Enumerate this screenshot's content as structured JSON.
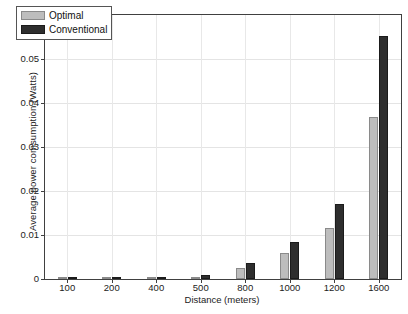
{
  "chart_data": {
    "type": "bar",
    "title": "",
    "xlabel": "Distance (meters)",
    "ylabel": "Average power comsumption (Watts)",
    "categories": [
      "100",
      "200",
      "400",
      "500",
      "800",
      "1000",
      "1200",
      "1600"
    ],
    "series": [
      {
        "name": "Optimal",
        "color": "#bdbdbd",
        "values": [
          2e-05,
          4e-05,
          0.00025,
          0.0004,
          0.0025,
          0.0059,
          0.0116,
          0.0368
        ]
      },
      {
        "name": "Conventional",
        "color": "#2e2e2e",
        "values": [
          3e-05,
          6e-05,
          0.0004,
          0.0008,
          0.0037,
          0.0084,
          0.017,
          0.0552
        ]
      }
    ],
    "ylim": [
      0,
      0.06
    ],
    "yticks": [
      "0",
      "0.01",
      "0.02",
      "0.03",
      "0.04",
      "0.05",
      "0.06"
    ],
    "ytick_values": [
      0,
      0.01,
      0.02,
      0.03,
      0.04,
      0.05,
      0.06
    ],
    "grid": true,
    "legend_position": "top-left"
  },
  "legend": {
    "items": [
      {
        "label": "Optimal"
      },
      {
        "label": "Conventional"
      }
    ]
  }
}
